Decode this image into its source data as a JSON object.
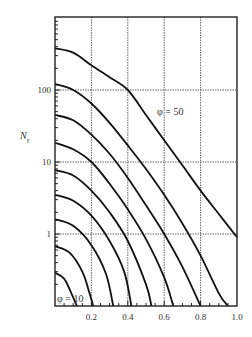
{
  "chart_data": {
    "type": "line",
    "title": "",
    "xlabel": "",
    "ylabel": "Nγ",
    "y_scale": "log",
    "xlim": [
      0,
      1.0
    ],
    "ylim": [
      0.1,
      1000
    ],
    "grid": true,
    "x_ticks": [
      0.2,
      0.4,
      0.6,
      0.8,
      1.0
    ],
    "x_tick_labels": [
      "0.2",
      "0.4",
      "0.6",
      "0.8",
      "1.0"
    ],
    "y_ticks": [
      1,
      10,
      100
    ],
    "y_tick_labels": [
      "1",
      "10",
      "100"
    ],
    "annotations": [
      {
        "text": "φ = 50",
        "x": 0.56,
        "y": 30
      },
      {
        "text": "φ = 10",
        "x": 0.02,
        "y": 0.13
      }
    ],
    "series": [
      {
        "name": "φ = 50",
        "x": [
          0,
          0.1,
          0.2,
          0.3,
          0.4,
          0.5,
          0.6,
          0.7,
          0.8,
          0.9,
          1.0
        ],
        "y": [
          380,
          330,
          220,
          150,
          100,
          45,
          20,
          9,
          4,
          1.9,
          0.9
        ]
      },
      {
        "name": "φ = 45",
        "x": [
          0,
          0.1,
          0.2,
          0.3,
          0.4,
          0.5,
          0.6,
          0.7,
          0.8,
          0.9,
          0.95
        ],
        "y": [
          121,
          100,
          65,
          35,
          17,
          8,
          3.5,
          1.4,
          0.5,
          0.15,
          0.1
        ]
      },
      {
        "name": "φ = 40",
        "x": [
          0,
          0.1,
          0.2,
          0.3,
          0.4,
          0.5,
          0.6,
          0.7,
          0.8
        ],
        "y": [
          45,
          38,
          24,
          13,
          6,
          2.5,
          1.0,
          0.35,
          0.1
        ]
      },
      {
        "name": "φ = 35",
        "x": [
          0,
          0.1,
          0.2,
          0.3,
          0.4,
          0.5,
          0.6,
          0.65
        ],
        "y": [
          18.5,
          15,
          10,
          5,
          2.2,
          0.85,
          0.25,
          0.1
        ]
      },
      {
        "name": "φ = 30",
        "x": [
          0,
          0.1,
          0.2,
          0.3,
          0.4,
          0.5,
          0.53
        ],
        "y": [
          7.7,
          6.5,
          4,
          2,
          0.8,
          0.2,
          0.1
        ]
      },
      {
        "name": "φ = 25",
        "x": [
          0,
          0.1,
          0.2,
          0.3,
          0.38,
          0.42
        ],
        "y": [
          3.5,
          2.9,
          1.8,
          0.8,
          0.3,
          0.1
        ]
      },
      {
        "name": "φ = 20",
        "x": [
          0,
          0.1,
          0.2,
          0.28,
          0.32
        ],
        "y": [
          1.6,
          1.3,
          0.7,
          0.28,
          0.1
        ]
      },
      {
        "name": "φ = 15",
        "x": [
          0,
          0.08,
          0.15,
          0.19,
          0.21
        ],
        "y": [
          0.68,
          0.55,
          0.3,
          0.15,
          0.1
        ]
      },
      {
        "name": "φ = 10",
        "x": [
          0,
          0.05,
          0.09,
          0.12
        ],
        "y": [
          0.29,
          0.24,
          0.15,
          0.1
        ]
      }
    ]
  }
}
